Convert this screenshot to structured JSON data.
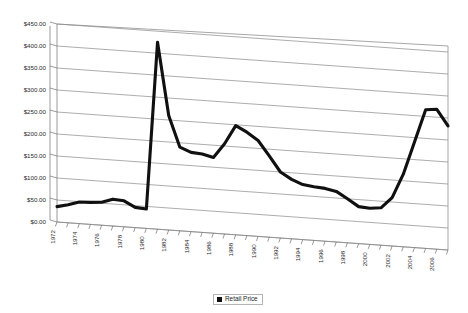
{
  "chart_data": {
    "type": "line",
    "title": "",
    "subtitle": "",
    "xlabel": "",
    "ylabel": "",
    "ylim": [
      0,
      450
    ],
    "ytick_step": 50,
    "ytick_labels": [
      "$0.00",
      "$50.00",
      "$100.00",
      "$150.00",
      "$200.00",
      "$250.00",
      "$300.00",
      "$350.00",
      "$400.00",
      "$450.00"
    ],
    "ytick_values": [
      0,
      50,
      100,
      150,
      200,
      250,
      300,
      350,
      400,
      450
    ],
    "grid": true,
    "grid_axis": "y",
    "legend_position": "bottom-center",
    "style": "3d-perspective",
    "xtick_labels": [
      "1972",
      "1974",
      "1976",
      "1978",
      "1980",
      "1982",
      "1984",
      "1986",
      "1988",
      "1990",
      "1992",
      "1994",
      "1996",
      "1998",
      "2000",
      "2002",
      "2004",
      "2006"
    ],
    "x": [
      1972,
      1973,
      1974,
      1975,
      1976,
      1977,
      1978,
      1979,
      1980,
      1981,
      1982,
      1983,
      1984,
      1985,
      1986,
      1987,
      1988,
      1989,
      1990,
      1991,
      1992,
      1993,
      1994,
      1995,
      1996,
      1997,
      1998,
      1999,
      2000,
      2001,
      2002,
      2003,
      2004,
      2005,
      2006,
      2007
    ],
    "series": [
      {
        "name": "Retail Price",
        "color": "#101010",
        "values": [
          35,
          41,
          49,
          50,
          52,
          61,
          59,
          46,
          44,
          425,
          260,
          190,
          180,
          178,
          172,
          205,
          248,
          235,
          218,
          185,
          150,
          135,
          125,
          122,
          120,
          115,
          100,
          84,
          82,
          85,
          110,
          165,
          240,
          315,
          318,
          282
        ]
      }
    ],
    "legend": [
      {
        "label": "Retail Price",
        "color": "#101010",
        "marker": "square"
      }
    ]
  },
  "legend": {
    "label": "Retail Price"
  }
}
